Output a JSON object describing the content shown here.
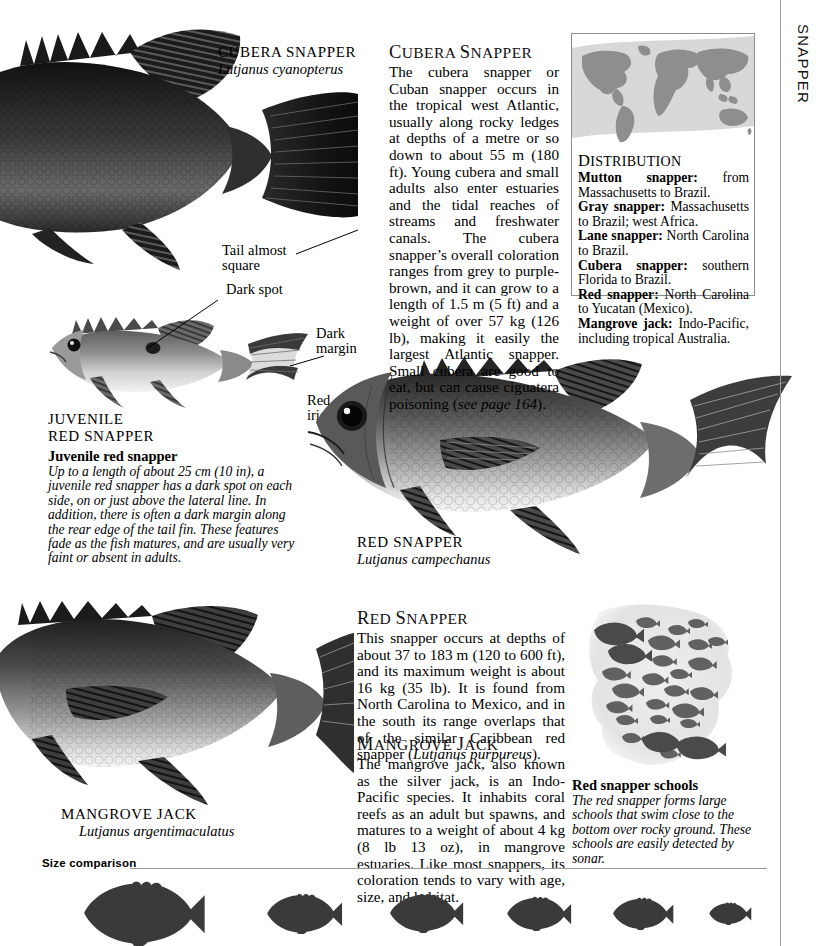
{
  "page": {
    "section_tab": "SNAPPER"
  },
  "specimens": {
    "cubera": {
      "common_name": "CUBERA SNAPPER",
      "scientific_name": "Lutjanus cyanopterus"
    },
    "juvenile_red": {
      "common_name_line1": "JUVENILE",
      "common_name_line2": "RED SNAPPER"
    },
    "red": {
      "common_name": "RED SNAPPER",
      "scientific_name": "Lutjanus campechanus"
    },
    "mangrove": {
      "common_name": "MANGROVE JACK",
      "scientific_name": "Lutjanus argentimaculatus"
    }
  },
  "callouts": {
    "tail_almost_square_line1": "Tail almost",
    "tail_almost_square_line2": "square",
    "dark_spot": "Dark spot",
    "dark_margin_line1": "Dark",
    "dark_margin_line2": "margin",
    "red_iris_line1": "Red",
    "red_iris_line2": "iris"
  },
  "articles": {
    "cubera": {
      "heading_cap": "C",
      "heading_rest": "UBERA ",
      "heading_cap2": "S",
      "heading_rest2": "NAPPER",
      "heading_plain": "Cubera Snapper",
      "body": "The cubera snapper or Cuban snapper occurs in the tropical west Atlantic, usually along rocky ledges at depths of a metre or so down to about 55 m (180 ft). Young cubera and small adults also enter estuaries and the tidal reaches of streams and freshwater canals. The cubera snapper’s overall coloration ranges from grey to purple-brown, and it can grow to a length of 1.5 m (5 ft) and a weight of over 57 kg (126 lb), making it easily the largest Atlantic snapper. Small cubera are good to eat, but can cause ciguatera poisoning (",
      "body_italic": "see page 164",
      "body_tail": ")."
    },
    "red_snapper": {
      "heading_cap": "R",
      "heading_rest": "ED ",
      "heading_cap2": "S",
      "heading_rest2": "NAPPER",
      "body": "This snapper occurs at depths of about 37 to 183 m (120 to 600 ft), and its maximum weight is about 16 kg (35 lb). It is found from North Carolina to Mexico, and in the south its range overlaps that of the similar Caribbean red snapper (",
      "body_italic": "Lutjanus purpureus",
      "body_tail": ")."
    },
    "mangrove_jack": {
      "heading_cap": "M",
      "heading_rest": "ANGROVE ",
      "heading_cap2": "J",
      "heading_rest2": "ACK",
      "body": "The mangrove jack, also known as the silver jack, is an Indo-Pacific species. It inhabits coral reefs as an adult but spawns, and matures to a weight of about 4 kg (8 lb 13 oz), in mangrove estuaries. Like most snappers, its coloration tends to vary with age, size, and habitat."
    }
  },
  "captions": {
    "juvenile_red_snapper": {
      "title": "Juvenile red snapper",
      "text": "Up to a length of about 25 cm (10 in), a juvenile red snapper has a dark spot on each side, on or just above the lateral line. In addition, there is often a dark margin along the rear edge of the tail fin. These features fade as the fish matures, and are usually very faint or absent in adults."
    },
    "red_snapper_schools": {
      "title": "Red snapper schools",
      "text": "The red snapper forms large schools that swim close to the bottom over rocky ground. These schools are easily detected by sonar."
    }
  },
  "distribution": {
    "title_cap": "D",
    "title_rest": "ISTRIBUTION",
    "entries": [
      {
        "species": "Mutton snapper:",
        "range": " from Massachusetts to Brazil."
      },
      {
        "species": "Gray snapper:",
        "range": " Massachusetts to Brazil; west Africa."
      },
      {
        "species": "Lane snapper:",
        "range": " North Carolina to Brazil."
      },
      {
        "species": "Cubera snapper:",
        "range": " southern Florida to Brazil."
      },
      {
        "species": "Red snapper:",
        "range": " North Carolina to Yucatan (Mexico)."
      },
      {
        "species": "Mangrove jack:",
        "range": " Indo-Pacific, including tropical Australia."
      }
    ]
  },
  "size_comparison": {
    "label": "Size comparison",
    "silhouette_count": 6,
    "relative_sizes": [
      1.0,
      0.62,
      0.6,
      0.52,
      0.5,
      0.34
    ]
  },
  "colors": {
    "ink": "#000000",
    "rule": "#9b9b9b",
    "map_land": "#8e8e8e",
    "map_water": "#d6d6d6",
    "silhouette": "#3a3a3a",
    "fish_dark": "#2b2b2b",
    "fish_mid": "#6f6f6f",
    "fish_light": "#c9c9c9"
  }
}
